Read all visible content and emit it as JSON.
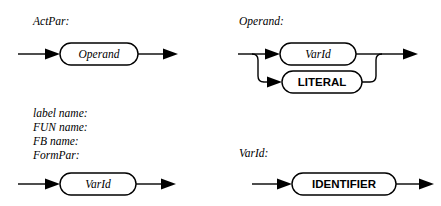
{
  "page": {
    "kind": "syntax-railroad-diagrams",
    "background_color": "#ffffff",
    "line_color": "#000000"
  },
  "diagrams": [
    {
      "id": "actpar",
      "heading": "ActPar:",
      "nodes": [
        {
          "label": "Operand",
          "kind": "nonterminal"
        }
      ]
    },
    {
      "id": "operand",
      "heading": "Operand:",
      "nodes": [
        {
          "label": "VarId",
          "kind": "nonterminal"
        },
        {
          "label": "LITERAL",
          "kind": "terminal"
        }
      ]
    },
    {
      "id": "names",
      "headings": [
        "label name:",
        "FUN name:",
        "FB name:",
        "FormPar:"
      ],
      "nodes": [
        {
          "label": "VarId",
          "kind": "nonterminal"
        }
      ]
    },
    {
      "id": "varid",
      "heading": "VarId:",
      "nodes": [
        {
          "label": "IDENTIFIER",
          "kind": "terminal"
        }
      ]
    }
  ]
}
